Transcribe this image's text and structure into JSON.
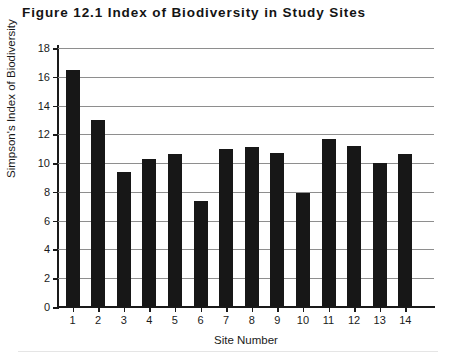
{
  "figure": {
    "title": "Figure 12.1  Index of Biodiversity in Study Sites"
  },
  "chart_data": {
    "type": "bar",
    "title": "Figure 12.1  Index of Biodiversity in Study Sites",
    "xlabel": "Site Number",
    "ylabel": "Simpson's Index of Biodiversity",
    "categories": [
      "1",
      "2",
      "3",
      "4",
      "5",
      "6",
      "7",
      "8",
      "9",
      "10",
      "11",
      "12",
      "13",
      "14"
    ],
    "values": [
      16.5,
      13.0,
      9.4,
      10.3,
      10.6,
      7.4,
      11.0,
      11.1,
      10.7,
      7.9,
      11.7,
      11.2,
      10.0,
      10.6
    ],
    "ylim": [
      0,
      18
    ],
    "ytick_step": 2,
    "yticks": [
      "0",
      "2",
      "4",
      "6",
      "8",
      "10",
      "12",
      "14",
      "16",
      "18"
    ],
    "grid": "horizontal",
    "legend": "none",
    "bar_color": "#171717",
    "gridline_color": "#8e8e8e",
    "axis_color": "#1a1a1a",
    "background_color": "#ffffff"
  }
}
